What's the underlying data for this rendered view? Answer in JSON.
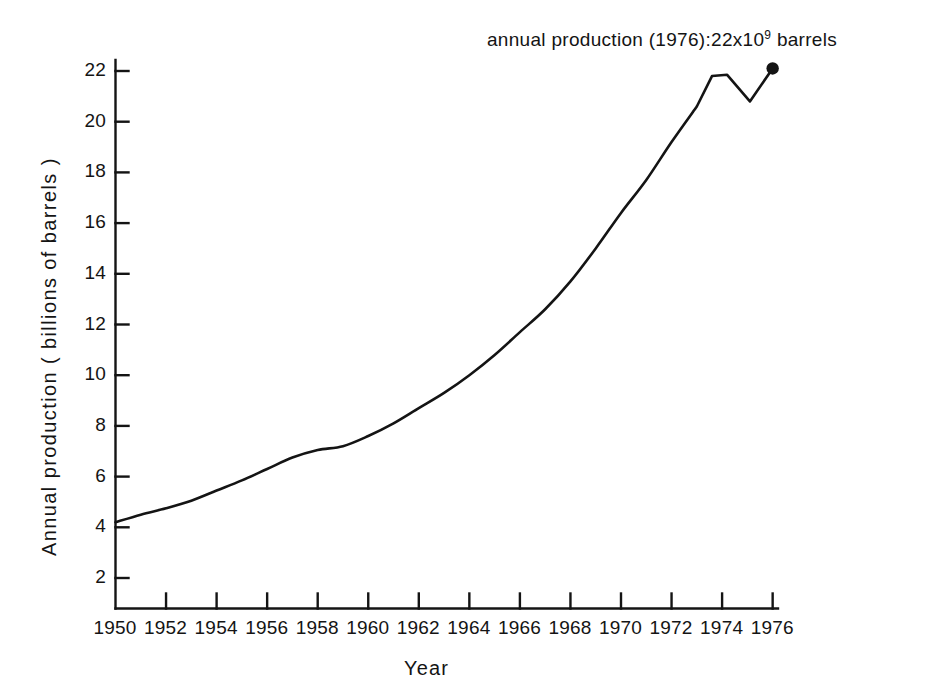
{
  "chart_data": {
    "type": "line",
    "title": "",
    "subtitle": "",
    "xlabel": "Year",
    "ylabel": "Annual production ( billions of barrels )",
    "xlim": [
      1950,
      1977.1
    ],
    "ylim": [
      0,
      23.1
    ],
    "grid": false,
    "legend": null,
    "xticks": [
      1950,
      1952,
      1954,
      1956,
      1958,
      1960,
      1962,
      1964,
      1966,
      1968,
      1970,
      1972,
      1974,
      1976
    ],
    "xtick_labels": [
      "1950",
      "1952",
      "1954",
      "1956",
      "1958",
      "1960",
      "1962",
      "1964",
      "1966",
      "1968",
      "1970",
      "1972",
      "1974",
      "1976"
    ],
    "yticks": [
      2,
      4,
      6,
      8,
      10,
      12,
      14,
      16,
      18,
      20,
      22
    ],
    "ytick_labels": [
      "2",
      "4",
      "6",
      "8",
      "10",
      "12",
      "14",
      "16",
      "18",
      "20",
      "22"
    ],
    "x": [
      1950,
      1951,
      1952,
      1953,
      1954,
      1955,
      1956,
      1957,
      1958,
      1959,
      1960,
      1961,
      1962,
      1963,
      1964,
      1965,
      1966,
      1967,
      1968,
      1969,
      1970,
      1971,
      1972,
      1973,
      1974,
      1975,
      1976
    ],
    "values": [
      4.2,
      4.5,
      4.75,
      5.05,
      5.45,
      5.85,
      6.3,
      6.75,
      7.05,
      7.2,
      7.6,
      8.1,
      8.7,
      9.3,
      10.0,
      10.8,
      11.7,
      12.6,
      13.7,
      15.0,
      16.4,
      17.7,
      19.2,
      20.6,
      21.8,
      21.85,
      20.8
    ],
    "series": [
      {
        "name": "Annual production",
        "values": [
          4.2,
          4.5,
          4.75,
          5.05,
          5.45,
          5.85,
          6.3,
          6.75,
          7.05,
          7.2,
          7.6,
          8.1,
          8.7,
          9.3,
          10.0,
          10.8,
          11.7,
          12.6,
          13.7,
          15.0,
          16.4,
          17.7,
          19.2,
          20.6,
          21.8,
          21.85,
          20.8,
          22.1
        ],
        "x": [
          1950,
          1951,
          1952,
          1953,
          1954,
          1955,
          1956,
          1957,
          1958,
          1959,
          1960,
          1961,
          1962,
          1963,
          1964,
          1965,
          1966,
          1967,
          1968,
          1969,
          1970,
          1971,
          1972,
          1973,
          1973.6,
          1974.2,
          1975.1,
          1976
        ]
      }
    ],
    "endpoint_marker": {
      "x": 1976,
      "y": 22.1,
      "shape": "filled-circle"
    },
    "annotations": [
      {
        "text_prefix": "annual production (1976):22x10",
        "exponent": "9",
        "text_suffix": " barrels",
        "x": 1976,
        "y": 23.0
      }
    ],
    "line_color": "#141414",
    "background_color": "#ffffff"
  },
  "axes": {
    "x_title": "Year",
    "y_title": "Annual production ( billions of barrels )"
  },
  "annotation": {
    "prefix": "annual production (1976):22x10",
    "exponent": "9",
    "suffix": " barrels"
  }
}
